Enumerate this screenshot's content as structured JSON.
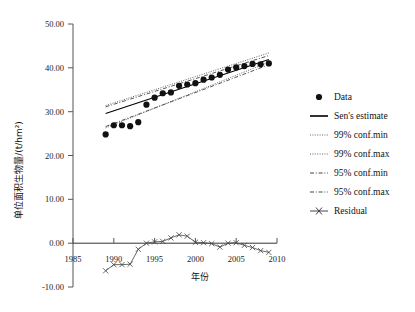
{
  "figure": {
    "background": "#ffffff",
    "width": 415,
    "height": 312
  },
  "chart_data": {
    "type": "scatter",
    "title": "",
    "subtitle": "",
    "xlabel": "年份",
    "ylabel": "单位面积生物量/(t/hm²)",
    "xlim": [
      1985,
      2010
    ],
    "ylim": [
      -10.0,
      50.0
    ],
    "grid": false,
    "legend_position": "right",
    "xticks": [
      1985,
      1990,
      1995,
      2000,
      2005,
      2010
    ],
    "xticklabels": [
      "1985",
      "1990",
      "1995",
      "2000",
      "2005",
      "2010"
    ],
    "yticks": [
      -10.0,
      0.0,
      10.0,
      20.0,
      30.0,
      40.0,
      50.0
    ],
    "yticklabels": [
      "-10.00",
      "0.00",
      "10.00",
      "20.00",
      "30.00",
      "40.00",
      "50.00"
    ],
    "x": [
      1989,
      1990,
      1991,
      1992,
      1993,
      1994,
      1995,
      1996,
      1997,
      1998,
      1999,
      2000,
      2001,
      2002,
      2003,
      2004,
      2005,
      2006,
      2007,
      2008,
      2009
    ],
    "series": [
      {
        "name": "Data",
        "type": "scatter",
        "marker": "filled-circle",
        "color": "#111111",
        "values": [
          24.8,
          26.9,
          26.9,
          26.7,
          27.6,
          31.6,
          33.2,
          34.2,
          34.4,
          35.9,
          36.2,
          36.5,
          37.3,
          37.8,
          38.4,
          39.6,
          40.1,
          40.4,
          40.9,
          40.8,
          41.0
        ]
      },
      {
        "name": "Sen's estimate",
        "type": "line",
        "style": "solid",
        "color": "#000000",
        "x": [
          1989,
          2009
        ],
        "values": [
          29.6,
          41.9
        ]
      },
      {
        "name": "99% conf.min",
        "type": "line",
        "style": "dotted",
        "color": "#555555",
        "x": [
          1989,
          2009
        ],
        "values": [
          26.3,
          41.3
        ]
      },
      {
        "name": "99% conf.max",
        "type": "line",
        "style": "dotted",
        "color": "#555555",
        "x": [
          1989,
          2009
        ],
        "values": [
          31.4,
          43.4
        ]
      },
      {
        "name": "95% conf.min",
        "type": "line",
        "style": "dashdot",
        "color": "#444444",
        "x": [
          1989,
          2009
        ],
        "values": [
          26.6,
          40.7
        ]
      },
      {
        "name": "95% conf.max",
        "type": "line",
        "style": "dashdot",
        "color": "#444444",
        "x": [
          1989,
          2009
        ],
        "values": [
          31.1,
          42.8
        ]
      },
      {
        "name": "Residual",
        "type": "line-marker",
        "marker": "x",
        "color": "#444444",
        "values": [
          -6.3,
          -4.9,
          -4.9,
          -4.8,
          -1.4,
          0.0,
          0.3,
          0.4,
          1.2,
          1.9,
          1.6,
          0.2,
          0.1,
          -0.1,
          -0.9,
          0.0,
          0.1,
          -0.5,
          -1.0,
          -1.7,
          -2.1
        ]
      }
    ],
    "legend": [
      {
        "label": "Data",
        "marker": "filled-circle"
      },
      {
        "label": "Sen's estimate",
        "marker": "solid-line"
      },
      {
        "label": "99% conf.min",
        "marker": "dotted-line"
      },
      {
        "label": "99% conf.max",
        "marker": "dotted-line"
      },
      {
        "label": "95% conf.min",
        "marker": "dashdot-line"
      },
      {
        "label": "95% conf.max",
        "marker": "dashdot-line"
      },
      {
        "label": "Residual",
        "marker": "x-line"
      }
    ]
  },
  "axis": {
    "y_label": "单位面积生物量/(t/hm²)",
    "x_label": "年份",
    "y_tick_50": "50.00",
    "y_tick_40": "40.00",
    "y_tick_30": "30.00",
    "y_tick_20": "20.00",
    "y_tick_10": "10.00",
    "y_tick_0": "0.00",
    "y_tick_neg10": "-10.00",
    "x_tick_1985": "1985",
    "x_tick_1990": "1990",
    "x_tick_1995": "1995",
    "x_tick_2000": "2000",
    "x_tick_2005": "2005",
    "x_tick_2010": "2010"
  },
  "legend": {
    "item_data": "Data",
    "item_sen": "Sen's estimate",
    "item_99min": "99% conf.min",
    "item_99max": "99% conf.max",
    "item_95min": "95% conf.min",
    "item_95max": "95% conf.max",
    "item_residual": "Residual"
  }
}
